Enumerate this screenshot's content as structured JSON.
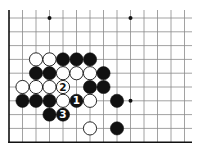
{
  "diagram": {
    "type": "go-board-fragment",
    "grid": {
      "columns": 14,
      "rows": 10,
      "origin_x": 9,
      "origin_y": 18,
      "spacing_x": 13.5,
      "spacing_y": 13.8,
      "line_color": "#8a8a8a",
      "edge_color": "#111111",
      "edges": [
        "left",
        "bottom"
      ]
    },
    "star_points": [
      {
        "col": 3,
        "row": 0
      },
      {
        "col": 9,
        "row": 0
      },
      {
        "col": 9,
        "row": 6
      }
    ],
    "stones": [
      {
        "col": 2,
        "row": 3,
        "color": "white"
      },
      {
        "col": 3,
        "row": 3,
        "color": "white"
      },
      {
        "col": 4,
        "row": 3,
        "color": "black"
      },
      {
        "col": 5,
        "row": 3,
        "color": "black"
      },
      {
        "col": 6,
        "row": 3,
        "color": "black"
      },
      {
        "col": 2,
        "row": 4,
        "color": "black"
      },
      {
        "col": 3,
        "row": 4,
        "color": "black"
      },
      {
        "col": 4,
        "row": 4,
        "color": "white"
      },
      {
        "col": 5,
        "row": 4,
        "color": "white"
      },
      {
        "col": 6,
        "row": 4,
        "color": "white"
      },
      {
        "col": 7,
        "row": 4,
        "color": "black"
      },
      {
        "col": 1,
        "row": 5,
        "color": "white"
      },
      {
        "col": 2,
        "row": 5,
        "color": "white"
      },
      {
        "col": 3,
        "row": 5,
        "color": "white"
      },
      {
        "col": 4,
        "row": 5,
        "color": "white",
        "label": "2"
      },
      {
        "col": 6,
        "row": 5,
        "color": "black"
      },
      {
        "col": 7,
        "row": 5,
        "color": "black"
      },
      {
        "col": 1,
        "row": 6,
        "color": "black"
      },
      {
        "col": 2,
        "row": 6,
        "color": "black"
      },
      {
        "col": 3,
        "row": 6,
        "color": "black"
      },
      {
        "col": 4,
        "row": 6,
        "color": "white"
      },
      {
        "col": 5,
        "row": 6,
        "color": "black",
        "label": "1"
      },
      {
        "col": 6,
        "row": 6,
        "color": "white"
      },
      {
        "col": 8,
        "row": 6,
        "color": "black"
      },
      {
        "col": 3,
        "row": 7,
        "color": "black"
      },
      {
        "col": 4,
        "row": 7,
        "color": "black",
        "label": "3"
      },
      {
        "col": 6,
        "row": 8,
        "color": "white"
      },
      {
        "col": 8,
        "row": 8,
        "color": "black"
      }
    ],
    "move_labels": [
      "1",
      "2",
      "3"
    ]
  }
}
